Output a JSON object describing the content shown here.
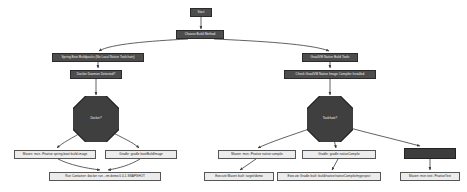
{
  "diagram": {
    "type": "flowchart",
    "orientation": "top-down",
    "colors": {
      "process_fill": "#4d4d4d",
      "process_text": "#f2f2f2",
      "terminal_fill": "#ececec",
      "terminal_text": "#1a1a1a",
      "decision_fill": "#3f3f3f",
      "edge": "#3a3a3a",
      "background": "#ffffff"
    },
    "nodes": [
      {
        "id": "start",
        "kind": "process",
        "label": "Start",
        "x": 190,
        "y": 8,
        "w": 22,
        "h": 9
      },
      {
        "id": "choose",
        "kind": "process",
        "label": "Choose Build Method",
        "x": 176,
        "y": 30,
        "w": 48,
        "h": 9
      },
      {
        "id": "buildpacks",
        "kind": "process",
        "label": "Spring Boot Buildpacks (No Local Native Toolchain)",
        "x": 52,
        "y": 53,
        "w": 92,
        "h": 9
      },
      {
        "id": "docker-detect",
        "kind": "process",
        "label": "Docker Daemon Detected?",
        "x": 70,
        "y": 70,
        "w": 52,
        "h": 9
      },
      {
        "id": "decision-left",
        "kind": "decision",
        "label": "Docker?",
        "x": 73,
        "y": 96,
        "w": 46,
        "h": 46
      },
      {
        "id": "mvn-image",
        "kind": "terminal",
        "label": "Maven: mvn -Pnative spring-boot:build-image",
        "x": 14,
        "y": 150,
        "w": 82,
        "h": 9
      },
      {
        "id": "gradle-image",
        "kind": "terminal",
        "label": "Gradle: gradle bootBuildImage",
        "x": 105,
        "y": 150,
        "w": 72,
        "h": 9
      },
      {
        "id": "run-container",
        "kind": "terminal",
        "label": "Run Container: docker run --rm demo:0.0.1-SNAPSHOT",
        "x": 49,
        "y": 172,
        "w": 112,
        "h": 9
      },
      {
        "id": "graalvm",
        "kind": "process",
        "label": "GraalVM Native Build Tools",
        "x": 302,
        "y": 53,
        "w": 56,
        "h": 9
      },
      {
        "id": "graalvm-detect",
        "kind": "process",
        "label": "Check GraalVM Native Image Compiler Installed",
        "x": 284,
        "y": 70,
        "w": 92,
        "h": 9
      },
      {
        "id": "decision-right",
        "kind": "decision",
        "label": "Toolchain?",
        "x": 307,
        "y": 96,
        "w": 46,
        "h": 46
      },
      {
        "id": "mvn-compile",
        "kind": "terminal",
        "label": "Maven: mvn -Pnative native:compile",
        "x": 218,
        "y": 150,
        "w": 78,
        "h": 9
      },
      {
        "id": "gradle-compile",
        "kind": "terminal",
        "label": "Gradle: gradle nativeCompile",
        "x": 302,
        "y": 150,
        "w": 74,
        "h": 9
      },
      {
        "id": "exec-mvn",
        "kind": "terminal",
        "label": "Execute Maven built: target/demo",
        "x": 204,
        "y": 172,
        "w": 70,
        "h": 9
      },
      {
        "id": "exec-gradle",
        "kind": "terminal",
        "label": "Execute Gradle built: build/native/nativeCompile/myproject",
        "x": 277,
        "y": 172,
        "w": 104,
        "h": 9
      },
      {
        "id": "install-graalvm",
        "kind": "process",
        "label": "",
        "x": 404,
        "y": 148,
        "w": 52,
        "h": 11
      },
      {
        "id": "mvn-test",
        "kind": "terminal",
        "label": "Maven: mvn test -PnativeTest",
        "x": 400,
        "y": 172,
        "w": 60,
        "h": 9
      }
    ],
    "edges": [
      {
        "from": "start",
        "to": "choose"
      },
      {
        "from": "choose",
        "to": "buildpacks"
      },
      {
        "from": "choose",
        "to": "graalvm"
      },
      {
        "from": "buildpacks",
        "to": "docker-detect"
      },
      {
        "from": "docker-detect",
        "to": "decision-left"
      },
      {
        "from": "decision-left",
        "to": "mvn-image"
      },
      {
        "from": "decision-left",
        "to": "gradle-image"
      },
      {
        "from": "mvn-image",
        "to": "run-container"
      },
      {
        "from": "gradle-image",
        "to": "run-container"
      },
      {
        "from": "graalvm",
        "to": "graalvm-detect"
      },
      {
        "from": "graalvm-detect",
        "to": "decision-right"
      },
      {
        "from": "decision-right",
        "to": "mvn-compile"
      },
      {
        "from": "decision-right",
        "to": "gradle-compile"
      },
      {
        "from": "decision-right",
        "to": "install-graalvm"
      },
      {
        "from": "mvn-compile",
        "to": "exec-mvn"
      },
      {
        "from": "gradle-compile",
        "to": "exec-gradle"
      },
      {
        "from": "install-graalvm",
        "to": "mvn-test"
      }
    ]
  }
}
